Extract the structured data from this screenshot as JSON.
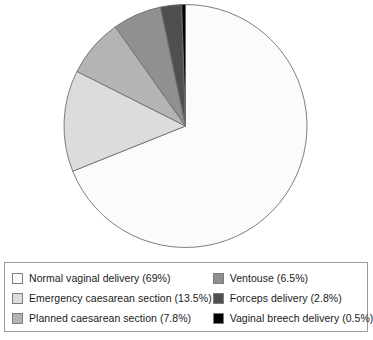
{
  "chart_data": {
    "type": "pie",
    "title": "",
    "subtitle": "",
    "xlabel": "",
    "ylabel": "",
    "units": "percent",
    "start_angle_deg": 0,
    "direction": "clockwise",
    "legend_position": "bottom",
    "grid": false,
    "categories": [
      "Normal vaginal delivery",
      "Emergency caesarean section",
      "Planned caesarean section",
      "Ventouse",
      "Forceps delivery",
      "Vaginal breech delivery"
    ],
    "values": [
      69,
      13.5,
      7.8,
      6.5,
      2.8,
      0.5
    ],
    "value_labels": [
      "69%",
      "13.5%",
      "7.8%",
      "6.5%",
      "2.8%",
      "0.5%"
    ],
    "colors": [
      "#fbfbfa",
      "#dcdcdc",
      "#b4b4b4",
      "#909090",
      "#4f4f4f",
      "#000000"
    ],
    "slices": [
      {
        "label": "Normal vaginal delivery",
        "value": 69,
        "value_label": "69%",
        "color": "#fbfbfa",
        "legend_text": "Normal vaginal delivery (69%)"
      },
      {
        "label": "Emergency caesarean section",
        "value": 13.5,
        "value_label": "13.5%",
        "color": "#dcdcdc",
        "legend_text": "Emergency caesarean section (13.5%)"
      },
      {
        "label": "Planned caesarean section",
        "value": 7.8,
        "value_label": "7.8%",
        "color": "#b4b4b4",
        "legend_text": "Planned caesarean section (7.8%)"
      },
      {
        "label": "Ventouse",
        "value": 6.5,
        "value_label": "6.5%",
        "color": "#909090",
        "legend_text": "Ventouse (6.5%)"
      },
      {
        "label": "Forceps delivery",
        "value": 2.8,
        "value_label": "2.8%",
        "color": "#4f4f4f",
        "legend_text": "Forceps delivery (2.8%)"
      },
      {
        "label": "Vaginal breech delivery",
        "value": 0.5,
        "value_label": "0.5%",
        "color": "#000000",
        "legend_text": "Vaginal breech delivery (0.5%)"
      }
    ]
  },
  "pie": {
    "center_x": 185.5,
    "center_y": 126,
    "radius": 121.5,
    "outline_color": "#6f6f6f"
  },
  "legend": {
    "border_color": "#9a9a9a",
    "columns": [
      {
        "items": [
          {
            "text": "Normal vaginal delivery (69%)",
            "color": "#fbfbfa"
          },
          {
            "text": "Emergency caesarean section (13.5%)",
            "color": "#dcdcdc"
          },
          {
            "text": "Planned caesarean section (7.8%)",
            "color": "#b4b4b4"
          }
        ]
      },
      {
        "items": [
          {
            "text": "Ventouse (6.5%)",
            "color": "#909090"
          },
          {
            "text": "Forceps delivery (2.8%)",
            "color": "#4f4f4f"
          },
          {
            "text": "Vaginal breech delivery (0.5%)",
            "color": "#000000"
          }
        ]
      }
    ]
  }
}
